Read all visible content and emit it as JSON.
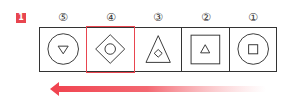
{
  "badge": {
    "label": "1",
    "color": "#e8454f"
  },
  "sequence": [
    {
      "index_label": "⑤",
      "outer_shape": "circle",
      "inner_shape": "triangle-down",
      "highlighted": false
    },
    {
      "index_label": "④",
      "outer_shape": "diamond",
      "inner_shape": "circle",
      "highlighted": true
    },
    {
      "index_label": "③",
      "outer_shape": "triangle-up",
      "inner_shape": "diamond",
      "highlighted": false
    },
    {
      "index_label": "②",
      "outer_shape": "square",
      "inner_shape": "triangle-up",
      "highlighted": false
    },
    {
      "index_label": "①",
      "outer_shape": "circle",
      "inner_shape": "square",
      "highlighted": false
    }
  ],
  "arrow": {
    "direction": "left",
    "color": "#f0424e"
  },
  "highlight_color": "#e8454f"
}
